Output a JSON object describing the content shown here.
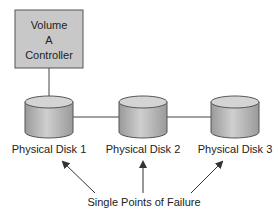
{
  "controller": {
    "line1": "Volume",
    "line2": "A",
    "line3": "Controller"
  },
  "disks": [
    {
      "label": "Physical Disk 1"
    },
    {
      "label": "Physical Disk 2"
    },
    {
      "label": "Physical Disk 3"
    }
  ],
  "caption": "Single Points of Failure",
  "colors": {
    "box_fill": "#c8c8c8",
    "disk_fill": "#b4b4b4",
    "disk_top": "#d0d0d0",
    "stroke": "#444444"
  }
}
